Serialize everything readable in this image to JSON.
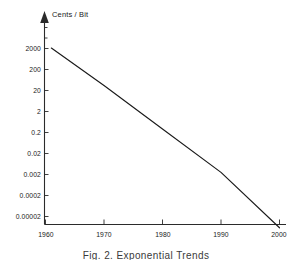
{
  "chart_data": {
    "type": "line",
    "title": "",
    "subtitle": "",
    "caption": "Fig. 2.  Exponential Trends",
    "ylabel": "Cents / Bit",
    "xlabel": "",
    "yscale": "log",
    "xscale": "linear",
    "grid": false,
    "legend": null,
    "xlim": [
      1960,
      2000
    ],
    "ylim": [
      2e-06,
      20000
    ],
    "xticks": [
      1960,
      1970,
      1980,
      1990,
      2000
    ],
    "xtick_labels": [
      "1960",
      "1970",
      "1980",
      "1990",
      "2000"
    ],
    "yticks": [
      2000,
      200,
      20,
      2,
      0.2,
      0.02,
      0.002,
      0.0002,
      2e-05
    ],
    "ytick_labels": [
      "2000",
      "200",
      "20",
      "2",
      "0.2",
      "0.02",
      "0.002",
      "0.0002",
      "0.00002"
    ],
    "series": [
      {
        "name": "Cost per bit",
        "color": "#1a1a1a",
        "x": [
          1961,
          2000
        ],
        "values": [
          2000,
          5.5e-06
        ],
        "points": [
          {
            "x": 1961,
            "y": 2000
          },
          {
            "x": 1970,
            "y": 33
          },
          {
            "x": 1980,
            "y": 0.28
          },
          {
            "x": 1990,
            "y": 0.0024
          },
          {
            "x": 2000,
            "y": 5.5e-06
          }
        ]
      }
    ],
    "annotations": []
  },
  "axis": {
    "y_arrow_icon": "up-arrow-icon",
    "y_title": "Cents / Bit"
  }
}
